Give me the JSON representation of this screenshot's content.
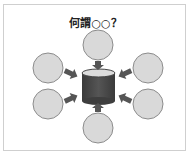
{
  "title": "何謂○○？",
  "colors": {
    "circle_fill": "#d9d9d9",
    "circle_stroke": "#8c8c8c",
    "arrow_fill": "#555555",
    "cylinder_body": "#4a4a4a",
    "cylinder_top": "#dcdcdc",
    "frame_border": "#cfcfcf"
  },
  "diagram": {
    "center": {
      "shape": "cylinder",
      "label": ""
    },
    "satellites": [
      {
        "position": "top",
        "label": ""
      },
      {
        "position": "upper-left",
        "label": ""
      },
      {
        "position": "upper-right",
        "label": ""
      },
      {
        "position": "lower-left",
        "label": ""
      },
      {
        "position": "lower-right",
        "label": ""
      },
      {
        "position": "bottom",
        "label": ""
      }
    ]
  }
}
